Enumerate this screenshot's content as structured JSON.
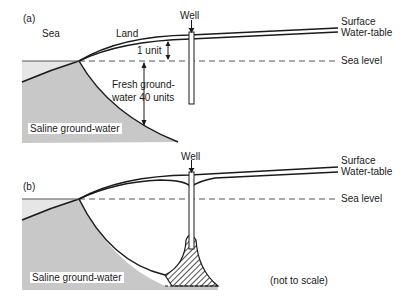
{
  "panel_a": {
    "tag": "(a)",
    "sea_label": "Sea",
    "land_label": "Land",
    "well_label": "Well",
    "surface_label": "Surface",
    "water_table_label": "Water-table",
    "sea_level_label": "Sea level",
    "one_unit_label": "1 unit",
    "fresh_line1": "Fresh ground-",
    "fresh_line2": "water 40 units",
    "saline_label": "Saline ground-water"
  },
  "panel_b": {
    "tag": "(b)",
    "well_label": "Well",
    "surface_label": "Surface",
    "water_table_label": "Water-table",
    "sea_level_label": "Sea level",
    "saline_label": "Saline ground-water",
    "scale_note": "(not to scale)"
  },
  "colors": {
    "saline_fill": "#c8c8c8",
    "sea_fill": "#e6e6e6",
    "line": "#1a1a1a"
  }
}
